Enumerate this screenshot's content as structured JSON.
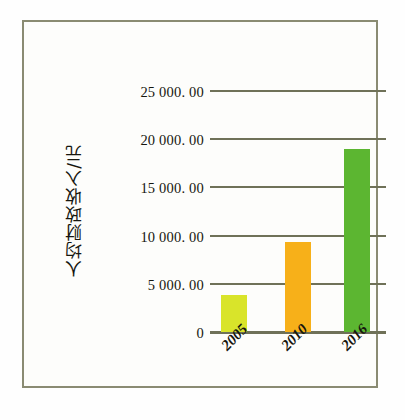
{
  "chart_data": {
    "type": "bar",
    "title": "",
    "xlabel": "",
    "ylabel": "人均财政收入/元",
    "categories": [
      "2005",
      "2010",
      "2016"
    ],
    "values": [
      3838,
      9340,
      19000
    ],
    "bar_colors": [
      "#d9e42a",
      "#f7b019",
      "#5cb631"
    ],
    "ylim": [
      0,
      25000
    ],
    "ytick_values": [
      0,
      5000,
      10000,
      15000,
      20000,
      25000
    ],
    "ytick_labels": [
      "0",
      "5 000. 00",
      "10 000. 00",
      "15 000. 00",
      "20 000. 00",
      "25 000. 00"
    ],
    "grid": true,
    "legend": "none",
    "gridline_color": "#6f7158",
    "frame_color": "#8a8b72",
    "background": "#fdfdfb"
  },
  "axis": {
    "y_title": "人均财政收入/元"
  }
}
